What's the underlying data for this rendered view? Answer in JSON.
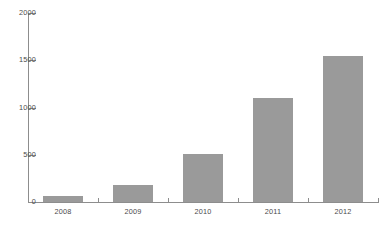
{
  "chart_data": {
    "type": "bar",
    "title": "",
    "subtitle": "",
    "xlabel": "",
    "ylabel": "",
    "categories": [
      "2008",
      "2009",
      "2010",
      "2011",
      "2012"
    ],
    "values": [
      65,
      185,
      510,
      1100,
      1550
    ],
    "series": [
      {
        "name": "",
        "values": [
          65,
          185,
          510,
          1100,
          1550
        ]
      }
    ],
    "ylim": [
      0,
      2000
    ],
    "yticks": [
      0,
      500,
      1000,
      1500,
      2000
    ],
    "ytick_labels": [
      "0",
      "500",
      "1000",
      "1500",
      "2000"
    ],
    "grid": false,
    "legend": false,
    "legend_position": "none",
    "bar_color": "#9a9a9a",
    "axis_color": "#8d8d8d",
    "text_color": "#4a4a4a",
    "background": "#ffffff"
  },
  "caption": {
    "text": ""
  }
}
